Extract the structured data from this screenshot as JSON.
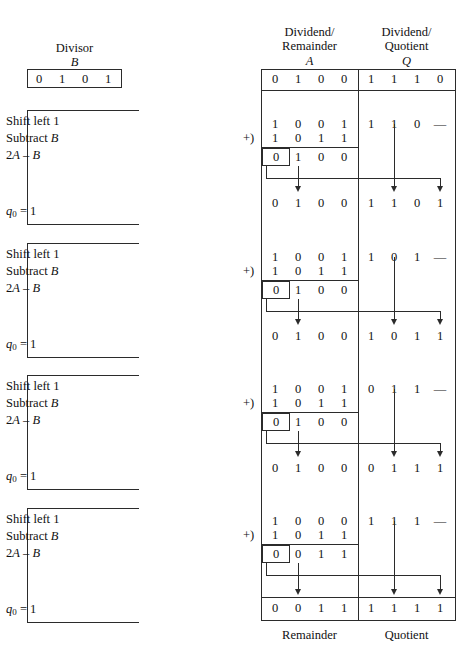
{
  "figure": {
    "divisor": {
      "caption": "Divisor",
      "symbol": "B",
      "bits": [
        "0",
        "1",
        "0",
        "1"
      ]
    },
    "columns": {
      "a": {
        "line1": "Dividend/",
        "line2": "Remainder",
        "symbol": "A",
        "footer": "Remainder"
      },
      "q": {
        "line1": "Dividend/",
        "line2": "Quotient",
        "symbol": "Q",
        "footer": "Quotient"
      }
    },
    "initial_row": {
      "a": [
        "0",
        "1",
        "0",
        "0"
      ],
      "q": [
        "1",
        "1",
        "1",
        "0"
      ]
    },
    "final_row": {
      "a": [
        "0",
        "0",
        "1",
        "1"
      ],
      "q": [
        "1",
        "1",
        "1",
        "1"
      ]
    },
    "plus_sign": "+)",
    "steps": [
      {
        "lines": [
          "Shift left 1",
          "Subtract B",
          "2A – B"
        ],
        "flag": "q0 = 1",
        "flag_sub": "0",
        "flag_value": "1",
        "shifted_a": [
          "1",
          "0",
          "0",
          "1"
        ],
        "addend": [
          "1",
          "0",
          "1",
          "1"
        ],
        "sum_a": [
          "0",
          "1",
          "0",
          "0"
        ],
        "shifted_q": [
          "1",
          "1",
          "0",
          "—"
        ],
        "result_a": [
          "0",
          "1",
          "0",
          "0"
        ],
        "result_q": [
          "1",
          "1",
          "0",
          "1"
        ]
      },
      {
        "lines": [
          "Shift left 1",
          "Subtract B",
          "2A – B"
        ],
        "flag": "q0 = 1",
        "flag_sub": "0",
        "flag_value": "1",
        "shifted_a": [
          "1",
          "0",
          "0",
          "1"
        ],
        "addend": [
          "1",
          "0",
          "1",
          "1"
        ],
        "sum_a": [
          "0",
          "1",
          "0",
          "0"
        ],
        "shifted_q": [
          "1",
          "0",
          "1",
          "—"
        ],
        "result_a": [
          "0",
          "1",
          "0",
          "0"
        ],
        "result_q": [
          "1",
          "0",
          "1",
          "1"
        ]
      },
      {
        "lines": [
          "Shift left 1",
          "Subtract B",
          "2A – B"
        ],
        "flag": "q0 = 1",
        "flag_sub": "0",
        "flag_value": "1",
        "shifted_a": [
          "1",
          "0",
          "0",
          "1"
        ],
        "addend": [
          "1",
          "0",
          "1",
          "1"
        ],
        "sum_a": [
          "0",
          "1",
          "0",
          "0"
        ],
        "shifted_q": [
          "0",
          "1",
          "1",
          "—"
        ],
        "result_a": [
          "0",
          "1",
          "0",
          "0"
        ],
        "result_q": [
          "0",
          "1",
          "1",
          "1"
        ]
      },
      {
        "lines": [
          "Shift left 1",
          "Subtract B",
          "2A – B"
        ],
        "flag": "q0 = 1",
        "flag_sub": "0",
        "flag_value": "1",
        "shifted_a": [
          "1",
          "0",
          "0",
          "0"
        ],
        "addend": [
          "1",
          "0",
          "1",
          "1"
        ],
        "sum_a": [
          "0",
          "0",
          "1",
          "1"
        ],
        "shifted_q": [
          "1",
          "1",
          "1",
          "—"
        ],
        "result_a": [
          "0",
          "0",
          "1",
          "1"
        ],
        "result_q": [
          "1",
          "1",
          "1",
          "1"
        ]
      }
    ]
  }
}
